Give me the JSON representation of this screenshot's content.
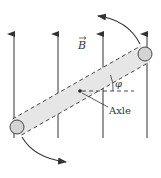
{
  "labels": {
    "field": "B",
    "angle": "φ",
    "axle": "Axle"
  },
  "colors": {
    "stroke": "#333333",
    "bar_fill": "#e6e6e6",
    "ball_fill": "#d4d4d4",
    "background": "#ffffff"
  },
  "field_lines": [
    {
      "x": 14
    },
    {
      "x": 58
    },
    {
      "x": 103
    },
    {
      "x": 147
    }
  ],
  "rotation_arrows": [
    {
      "name": "upper",
      "direction": "counterclockwise"
    },
    {
      "name": "lower",
      "direction": "counterclockwise"
    }
  ]
}
